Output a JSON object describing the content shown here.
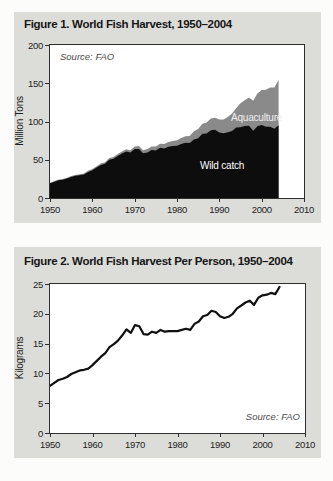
{
  "figure1": {
    "title": "Figure 1. World Fish Harvest, 1950–2004",
    "source": "Source: FAO",
    "ylabel": "Million Tons",
    "aquaculture_label": "Aquaculture",
    "wild_catch_label": "Wild catch"
  },
  "figure2": {
    "title": "Figure 2. World Fish Harvest Per Person, 1950–2004",
    "source": "Source: FAO",
    "ylabel": "Kilograms"
  },
  "colors": {
    "panel_background": "#dcdcd8",
    "plot_background": "#ffffff",
    "axis": "#2f2f2f",
    "wild_catch": "#0d0d0d",
    "aquaculture": "#8a8a8a",
    "line": "#101010",
    "text": "#1d1d1d",
    "source_text": "#4d4d4d"
  },
  "chart_data": [
    {
      "type": "area",
      "title": "Figure 1. World Fish Harvest, 1950–2004",
      "xlabel": "",
      "ylabel": "Million Tons",
      "source": "Source: FAO",
      "xlim": [
        1950,
        2010
      ],
      "ylim": [
        0,
        200
      ],
      "x_ticks": [
        1950,
        1960,
        1970,
        1980,
        1990,
        2000,
        2010
      ],
      "y_ticks": [
        0,
        50,
        100,
        150,
        200
      ],
      "grid": false,
      "legend_position": "labels-inside-areas",
      "stacked": true,
      "years": [
        1950,
        1951,
        1952,
        1953,
        1954,
        1955,
        1956,
        1957,
        1958,
        1959,
        1960,
        1961,
        1962,
        1963,
        1964,
        1965,
        1966,
        1967,
        1968,
        1969,
        1970,
        1971,
        1972,
        1973,
        1974,
        1975,
        1976,
        1977,
        1978,
        1979,
        1980,
        1981,
        1982,
        1983,
        1984,
        1985,
        1986,
        1987,
        1988,
        1989,
        1990,
        1991,
        1992,
        1993,
        1994,
        1995,
        1996,
        1997,
        1998,
        1999,
        2000,
        2001,
        2002,
        2003,
        2004
      ],
      "series": [
        {
          "name": "Wild catch",
          "color": "#0d0d0d",
          "values": [
            19.2,
            21.3,
            23.2,
            23.9,
            25.5,
            27.5,
            29.0,
            29.8,
            30.8,
            34.1,
            36.4,
            39.7,
            43.2,
            44.8,
            49.9,
            51.3,
            55.0,
            58.3,
            60.8,
            59.3,
            63.9,
            64.2,
            58.5,
            59.6,
            62.8,
            62.2,
            65.7,
            64.9,
            67.1,
            68.1,
            68.3,
            70.6,
            72.1,
            71.7,
            76.6,
            78.2,
            84.0,
            84.5,
            88.6,
            89.1,
            85.8,
            84.7,
            85.9,
            87.7,
            92.1,
            92.6,
            94.1,
            94.4,
            88.0,
            93.7,
            95.6,
            93.1,
            93.2,
            90.5,
            95.0
          ]
        },
        {
          "name": "Aquaculture",
          "color": "#8a8a8a",
          "values": [
            0.6,
            0.7,
            0.8,
            0.9,
            1.0,
            1.1,
            1.2,
            1.3,
            1.4,
            1.5,
            1.7,
            1.8,
            1.9,
            2.0,
            2.2,
            2.3,
            2.5,
            2.6,
            2.8,
            3.0,
            3.5,
            3.8,
            4.0,
            4.3,
            4.6,
            5.0,
            5.3,
            5.7,
            6.1,
            6.6,
            7.3,
            7.9,
            8.7,
            9.5,
            10.7,
            11.9,
            13.1,
            14.3,
            15.3,
            15.9,
            16.8,
            17.8,
            19.8,
            22.6,
            25.5,
            31.2,
            33.6,
            36.8,
            39.1,
            43.0,
            45.7,
            48.4,
            51.2,
            54.1,
            59.4
          ]
        }
      ]
    },
    {
      "type": "line",
      "title": "Figure 2. World Fish Harvest Per Person, 1950–2004",
      "xlabel": "",
      "ylabel": "Kilograms",
      "source": "Source: FAO",
      "xlim": [
        1950,
        2010
      ],
      "ylim": [
        0,
        25
      ],
      "x_ticks": [
        1950,
        1960,
        1970,
        1980,
        1990,
        2000,
        2010
      ],
      "y_ticks": [
        0,
        5,
        10,
        15,
        20,
        25
      ],
      "grid": false,
      "line_color": "#101010",
      "years": [
        1950,
        1951,
        1952,
        1953,
        1954,
        1955,
        1956,
        1957,
        1958,
        1959,
        1960,
        1961,
        1962,
        1963,
        1964,
        1965,
        1966,
        1967,
        1968,
        1969,
        1970,
        1971,
        1972,
        1973,
        1974,
        1975,
        1976,
        1977,
        1978,
        1979,
        1980,
        1981,
        1982,
        1983,
        1984,
        1985,
        1986,
        1987,
        1988,
        1989,
        1990,
        1991,
        1992,
        1993,
        1994,
        1995,
        1996,
        1997,
        1998,
        1999,
        2000,
        2001,
        2002,
        2003,
        2004
      ],
      "values": [
        7.9,
        8.4,
        8.9,
        9.1,
        9.4,
        9.9,
        10.2,
        10.5,
        10.6,
        10.8,
        11.4,
        12.1,
        12.8,
        13.4,
        14.4,
        14.9,
        15.5,
        16.4,
        17.4,
        16.8,
        18.1,
        17.9,
        16.6,
        16.5,
        17.0,
        16.8,
        17.3,
        17.0,
        17.1,
        17.1,
        17.1,
        17.3,
        17.5,
        17.3,
        18.3,
        18.7,
        19.6,
        19.8,
        20.5,
        20.3,
        19.6,
        19.3,
        19.5,
        20.0,
        20.9,
        21.4,
        21.9,
        22.2,
        21.5,
        22.7,
        23.1,
        23.2,
        23.5,
        23.3,
        24.5
      ]
    }
  ]
}
